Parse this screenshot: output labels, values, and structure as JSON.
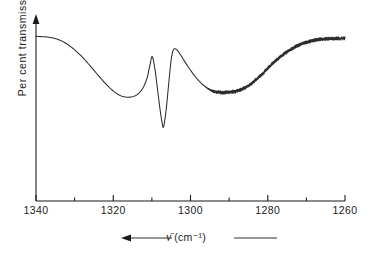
{
  "chart_data": {
    "type": "line",
    "title": "",
    "xlabel": "ν̄ (cm⁻¹)",
    "ylabel": "Per cent transmission",
    "xlim": [
      1340,
      1260
    ],
    "x_axis_reversed": true,
    "ylim": [
      0,
      100
    ],
    "grid": false,
    "legend": null,
    "x_ticks_major": [
      1340,
      1320,
      1300,
      1280,
      1260
    ],
    "x_tick_labels": [
      "1340",
      "1320",
      "1300",
      "1280",
      "1260"
    ],
    "x_ticks_minor": [
      1330,
      1310,
      1290,
      1270
    ],
    "y_ticks": [],
    "y_tick_labels": [],
    "y_axis_arrow": "up",
    "x_axis_arrow": "left",
    "series": [
      {
        "name": "transmission",
        "noise_region": [
          1297,
          1260
        ],
        "points": [
          [
            1340.0,
            92.0
          ],
          [
            1338.5,
            91.8
          ],
          [
            1337.0,
            91.6
          ],
          [
            1335.5,
            91.0
          ],
          [
            1334.0,
            90.0
          ],
          [
            1332.5,
            88.4
          ],
          [
            1331.0,
            86.2
          ],
          [
            1329.5,
            83.5
          ],
          [
            1328.0,
            80.4
          ],
          [
            1326.5,
            76.8
          ],
          [
            1325.0,
            73.0
          ],
          [
            1323.5,
            69.2
          ],
          [
            1322.0,
            65.6
          ],
          [
            1320.5,
            62.4
          ],
          [
            1319.0,
            59.9
          ],
          [
            1317.5,
            58.4
          ],
          [
            1316.0,
            58.0
          ],
          [
            1314.5,
            58.6
          ],
          [
            1313.5,
            60.0
          ],
          [
            1312.5,
            62.5
          ],
          [
            1311.8,
            65.5
          ],
          [
            1311.2,
            69.0
          ],
          [
            1310.8,
            73.0
          ],
          [
            1310.4,
            77.0
          ],
          [
            1310.1,
            80.0
          ],
          [
            1309.9,
            80.6
          ],
          [
            1309.6,
            78.5
          ],
          [
            1309.2,
            73.5
          ],
          [
            1308.8,
            67.0
          ],
          [
            1308.4,
            60.0
          ],
          [
            1308.0,
            53.0
          ],
          [
            1307.6,
            47.0
          ],
          [
            1307.3,
            43.0
          ],
          [
            1307.1,
            41.2
          ],
          [
            1306.9,
            42.0
          ],
          [
            1306.6,
            46.0
          ],
          [
            1306.2,
            53.0
          ],
          [
            1305.8,
            62.0
          ],
          [
            1305.4,
            71.0
          ],
          [
            1305.0,
            79.0
          ],
          [
            1304.6,
            83.5
          ],
          [
            1304.2,
            85.0
          ],
          [
            1303.6,
            84.6
          ],
          [
            1303.0,
            83.0
          ],
          [
            1302.2,
            80.4
          ],
          [
            1301.4,
            77.6
          ],
          [
            1300.5,
            74.6
          ],
          [
            1299.5,
            71.6
          ],
          [
            1298.5,
            68.8
          ],
          [
            1297.5,
            66.4
          ],
          [
            1296.5,
            64.4
          ],
          [
            1295.5,
            62.8
          ],
          [
            1294.5,
            61.6
          ],
          [
            1293.5,
            61.0
          ],
          [
            1292.5,
            60.7
          ],
          [
            1291.5,
            60.6
          ],
          [
            1290.5,
            60.7
          ],
          [
            1289.5,
            60.9
          ],
          [
            1288.5,
            61.2
          ],
          [
            1287.5,
            61.8
          ],
          [
            1286.5,
            62.6
          ],
          [
            1285.5,
            63.8
          ],
          [
            1284.5,
            65.2
          ],
          [
            1283.5,
            66.9
          ],
          [
            1282.5,
            68.8
          ],
          [
            1281.5,
            70.8
          ],
          [
            1280.5,
            73.0
          ],
          [
            1279.5,
            75.2
          ],
          [
            1278.5,
            77.2
          ],
          [
            1277.5,
            79.2
          ],
          [
            1276.5,
            81.0
          ],
          [
            1275.5,
            82.6
          ],
          [
            1274.5,
            84.0
          ],
          [
            1273.5,
            85.4
          ],
          [
            1272.5,
            86.6
          ],
          [
            1271.5,
            87.6
          ],
          [
            1270.5,
            88.4
          ],
          [
            1269.5,
            89.0
          ],
          [
            1268.5,
            89.6
          ],
          [
            1267.5,
            90.0
          ],
          [
            1266.5,
            90.3
          ],
          [
            1265.5,
            90.5
          ],
          [
            1264.5,
            90.6
          ],
          [
            1263.5,
            90.7
          ],
          [
            1262.5,
            90.8
          ],
          [
            1261.5,
            90.8
          ],
          [
            1260.0,
            90.9
          ]
        ]
      }
    ],
    "annotations": {
      "broad_minimum_cm1": 1316,
      "sharp_peak_cm1": 1310,
      "deep_trough_cm1": 1307,
      "second_peak_cm1": 1304,
      "shallow_valley_cm1": 1291,
      "plateau_start_cm1": 1265
    }
  },
  "axis": {
    "y_title": "Per cent transmission",
    "x_caption_symbol": "ν̄",
    "x_caption_units": "(cm⁻¹)"
  },
  "colors": {
    "line": "#2b2b2b",
    "axis": "#1a1a1a",
    "background": "#ffffff"
  }
}
